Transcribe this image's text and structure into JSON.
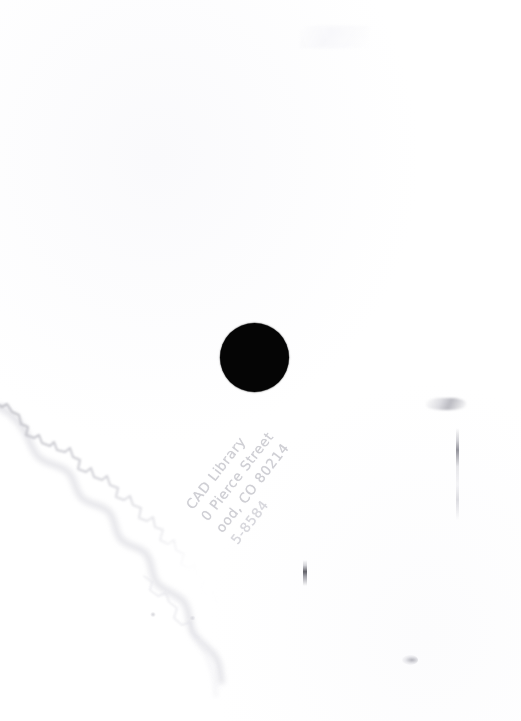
{
  "image": {
    "kind": "scanned-page",
    "width": 521,
    "height": 721,
    "background_color": "#ffffff",
    "description": "Blank white scanned page with a solid black dot and a faint rotated library address stamp"
  },
  "marks": {
    "black_dot": {
      "name": "black-dot",
      "color": "#050505",
      "center_x": 254,
      "center_y": 357,
      "diameter": 69
    },
    "tear_edge": {
      "name": "torn-paper-edge",
      "color": "#c8c8cd",
      "description": "Jagged soft-shadow torn paper edge running diagonally from the left margin down toward the lower middle"
    }
  },
  "stamp": {
    "name": "library-address-stamp",
    "rotation_degrees": -52,
    "color": "#c7c7cd",
    "lines": [
      "CAD Library",
      "0 Pierce Street",
      "ood, CO 80214",
      "5-8584"
    ],
    "line_1": "CAD Library",
    "line_2": "0 Pierce Street",
    "line_3": "ood, CO 80214",
    "line_4": "5-8584"
  },
  "artifacts": [
    {
      "name": "vertical-streak",
      "x": 456,
      "y": 428
    },
    {
      "name": "smudge",
      "x": 426,
      "y": 398
    },
    {
      "name": "dark-speck",
      "x": 303,
      "y": 560
    },
    {
      "name": "faint-speck",
      "x": 402,
      "y": 655
    }
  ]
}
